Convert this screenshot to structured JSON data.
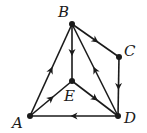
{
  "diagram": {
    "type": "directed-graph",
    "nodes": [
      {
        "id": "A",
        "label": "A",
        "x": 30,
        "y": 116,
        "label_x": 12,
        "label_y": 128
      },
      {
        "id": "B",
        "label": "B",
        "x": 72,
        "y": 24,
        "label_x": 58,
        "label_y": 17
      },
      {
        "id": "C",
        "label": "C",
        "x": 119,
        "y": 57,
        "label_x": 124,
        "label_y": 56
      },
      {
        "id": "D",
        "label": "D",
        "x": 118,
        "y": 116,
        "label_x": 124,
        "label_y": 123
      },
      {
        "id": "E",
        "label": "E",
        "x": 72,
        "y": 81,
        "label_x": 64,
        "label_y": 101
      }
    ],
    "edges": [
      {
        "from": "B",
        "to": "C"
      },
      {
        "from": "C",
        "to": "D"
      },
      {
        "from": "B",
        "to": "E"
      },
      {
        "from": "A",
        "to": "B"
      },
      {
        "from": "A",
        "to": "E"
      },
      {
        "from": "E",
        "to": "D"
      },
      {
        "from": "D",
        "to": "B"
      },
      {
        "from": "D",
        "to": "A"
      }
    ]
  }
}
